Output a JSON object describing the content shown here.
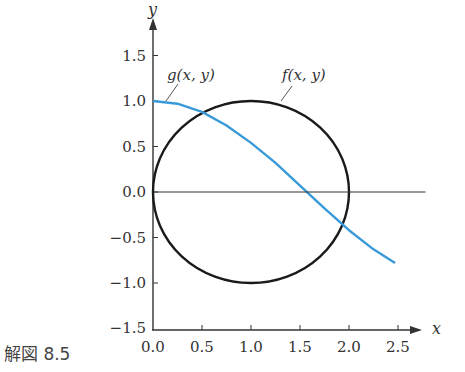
{
  "caption": "解図 8.5",
  "chart_data": {
    "type": "line",
    "title": "",
    "xlabel": "x",
    "ylabel": "y",
    "xlim": [
      0.0,
      2.7
    ],
    "ylim": [
      -1.5,
      1.6
    ],
    "grid": false,
    "x_ticks": [
      "0.0",
      "0.5",
      "1.0",
      "1.5",
      "2.0",
      "2.5"
    ],
    "y_ticks": [
      "−1.5",
      "−1.0",
      "−0.5",
      "0.0",
      "0.5",
      "1.0",
      "1.5"
    ],
    "series": [
      {
        "name": "f(x, y)",
        "kind": "circle",
        "center": [
          1.0,
          0.0
        ],
        "radius": 1.0,
        "color": "#1a1a1a"
      },
      {
        "name": "g(x, y)",
        "kind": "curve",
        "color": "#3a9ad9",
        "x": [
          0.0,
          0.25,
          0.5,
          0.75,
          1.0,
          1.25,
          1.5,
          1.75,
          2.0,
          2.25,
          2.47
        ],
        "y": [
          1.0,
          0.97,
          0.88,
          0.73,
          0.54,
          0.32,
          0.07,
          -0.18,
          -0.42,
          -0.63,
          -0.78
        ]
      },
      {
        "name": "y=0 reference line",
        "kind": "hline",
        "y": 0.0,
        "x_range": [
          0.0,
          2.78
        ],
        "color": "#333333"
      }
    ],
    "annotations": [
      {
        "text": "g(x, y)",
        "target": "g curve near (0.1, 0.98)"
      },
      {
        "text": "f(x, y)",
        "target": "circle near (1.2, 0.98)"
      }
    ]
  }
}
